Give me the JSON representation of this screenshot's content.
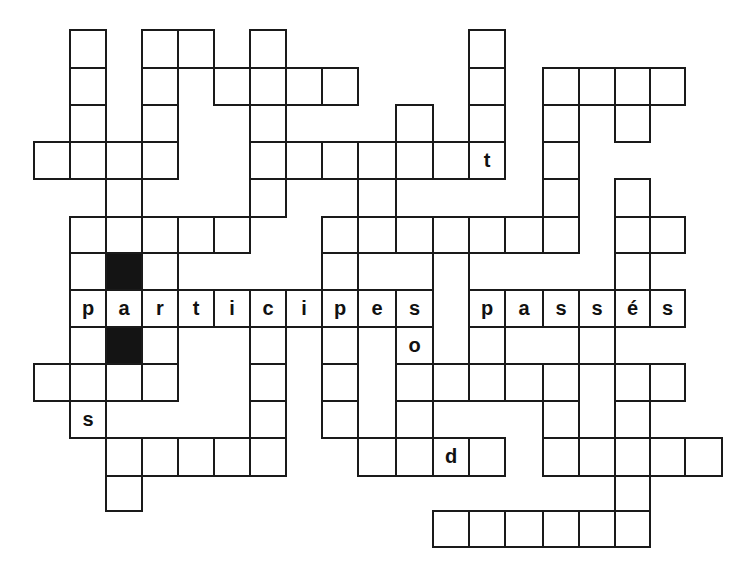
{
  "puzzle": {
    "title_fragment_visible": false,
    "cell_border_color": "#1a1a1a",
    "black_cell_color": "#141414",
    "background_color": "#ffffff",
    "col_edges": [
      34,
      70,
      106,
      142,
      178,
      214,
      250,
      286,
      322,
      358,
      396,
      433,
      469,
      505,
      543,
      579,
      615,
      650,
      685,
      722
    ],
    "row_edges": [
      30,
      68,
      105,
      142,
      179,
      217,
      253,
      290,
      327,
      364,
      401,
      438,
      476,
      511,
      547
    ],
    "horizontal_word": {
      "label": "participes passés",
      "row": 7
    },
    "cells": [
      {
        "r": 0,
        "c": 1
      },
      {
        "r": 0,
        "c": 3
      },
      {
        "r": 0,
        "c": 4
      },
      {
        "r": 0,
        "c": 6
      },
      {
        "r": 0,
        "c": 12
      },
      {
        "r": 1,
        "c": 1
      },
      {
        "r": 1,
        "c": 3
      },
      {
        "r": 1,
        "c": 5
      },
      {
        "r": 1,
        "c": 6
      },
      {
        "r": 1,
        "c": 7
      },
      {
        "r": 1,
        "c": 8
      },
      {
        "r": 1,
        "c": 12
      },
      {
        "r": 1,
        "c": 14
      },
      {
        "r": 1,
        "c": 15
      },
      {
        "r": 1,
        "c": 16
      },
      {
        "r": 1,
        "c": 17
      },
      {
        "r": 2,
        "c": 1
      },
      {
        "r": 2,
        "c": 3
      },
      {
        "r": 2,
        "c": 6
      },
      {
        "r": 2,
        "c": 10
      },
      {
        "r": 2,
        "c": 12
      },
      {
        "r": 2,
        "c": 14
      },
      {
        "r": 2,
        "c": 16
      },
      {
        "r": 3,
        "c": 0
      },
      {
        "r": 3,
        "c": 1
      },
      {
        "r": 3,
        "c": 2
      },
      {
        "r": 3,
        "c": 3
      },
      {
        "r": 3,
        "c": 6
      },
      {
        "r": 3,
        "c": 7
      },
      {
        "r": 3,
        "c": 8
      },
      {
        "r": 3,
        "c": 9
      },
      {
        "r": 3,
        "c": 10
      },
      {
        "r": 3,
        "c": 11
      },
      {
        "r": 3,
        "c": 12,
        "letter": "t"
      },
      {
        "r": 3,
        "c": 14
      },
      {
        "r": 4,
        "c": 2
      },
      {
        "r": 4,
        "c": 6
      },
      {
        "r": 4,
        "c": 9
      },
      {
        "r": 4,
        "c": 14
      },
      {
        "r": 4,
        "c": 16
      },
      {
        "r": 5,
        "c": 1
      },
      {
        "r": 5,
        "c": 2
      },
      {
        "r": 5,
        "c": 3
      },
      {
        "r": 5,
        "c": 4
      },
      {
        "r": 5,
        "c": 5
      },
      {
        "r": 5,
        "c": 8
      },
      {
        "r": 5,
        "c": 9
      },
      {
        "r": 5,
        "c": 10
      },
      {
        "r": 5,
        "c": 11
      },
      {
        "r": 5,
        "c": 12
      },
      {
        "r": 5,
        "c": 13
      },
      {
        "r": 5,
        "c": 14
      },
      {
        "r": 5,
        "c": 16
      },
      {
        "r": 5,
        "c": 17
      },
      {
        "r": 6,
        "c": 1
      },
      {
        "r": 6,
        "c": 2,
        "black": true
      },
      {
        "r": 6,
        "c": 3
      },
      {
        "r": 6,
        "c": 8
      },
      {
        "r": 6,
        "c": 9,
        "w": 2
      },
      {
        "r": 6,
        "c": 11,
        "h": 3
      },
      {
        "r": 6,
        "c": 16
      },
      {
        "r": 7,
        "c": 1,
        "letter": "p"
      },
      {
        "r": 7,
        "c": 2,
        "letter": "a"
      },
      {
        "r": 7,
        "c": 3,
        "letter": "r"
      },
      {
        "r": 7,
        "c": 4,
        "letter": "t"
      },
      {
        "r": 7,
        "c": 5,
        "letter": "i"
      },
      {
        "r": 7,
        "c": 6,
        "letter": "c"
      },
      {
        "r": 7,
        "c": 7,
        "letter": "i"
      },
      {
        "r": 7,
        "c": 8,
        "letter": "p"
      },
      {
        "r": 7,
        "c": 9,
        "letter": "e"
      },
      {
        "r": 7,
        "c": 10,
        "letter": "s"
      },
      {
        "r": 7,
        "c": 12,
        "letter": "p"
      },
      {
        "r": 7,
        "c": 13,
        "letter": "a"
      },
      {
        "r": 7,
        "c": 14,
        "letter": "s"
      },
      {
        "r": 7,
        "c": 15,
        "letter": "s"
      },
      {
        "r": 7,
        "c": 16,
        "letter": "é"
      },
      {
        "r": 7,
        "c": 17,
        "letter": "s"
      },
      {
        "r": 8,
        "c": 1
      },
      {
        "r": 8,
        "c": 2,
        "black": true
      },
      {
        "r": 8,
        "c": 3
      },
      {
        "r": 8,
        "c": 6
      },
      {
        "r": 8,
        "c": 8
      },
      {
        "r": 8,
        "c": 9,
        "h": 3
      },
      {
        "r": 8,
        "c": 10,
        "letter": "o"
      },
      {
        "r": 8,
        "c": 12
      },
      {
        "r": 8,
        "c": 13,
        "w": 2
      },
      {
        "r": 8,
        "c": 15
      },
      {
        "r": 9,
        "c": 0
      },
      {
        "r": 9,
        "c": 1
      },
      {
        "r": 9,
        "c": 2
      },
      {
        "r": 9,
        "c": 3
      },
      {
        "r": 9,
        "c": 6
      },
      {
        "r": 9,
        "c": 8
      },
      {
        "r": 9,
        "c": 10
      },
      {
        "r": 9,
        "c": 11
      },
      {
        "r": 9,
        "c": 12
      },
      {
        "r": 9,
        "c": 13
      },
      {
        "r": 9,
        "c": 14
      },
      {
        "r": 9,
        "c": 15,
        "h": 2
      },
      {
        "r": 9,
        "c": 16
      },
      {
        "r": 9,
        "c": 17
      },
      {
        "r": 10,
        "c": 1,
        "letter": "s"
      },
      {
        "r": 10,
        "c": 6
      },
      {
        "r": 10,
        "c": 8
      },
      {
        "r": 10,
        "c": 10
      },
      {
        "r": 10,
        "c": 14
      },
      {
        "r": 10,
        "c": 16
      },
      {
        "r": 11,
        "c": 2
      },
      {
        "r": 11,
        "c": 3
      },
      {
        "r": 11,
        "c": 4
      },
      {
        "r": 11,
        "c": 5
      },
      {
        "r": 11,
        "c": 6
      },
      {
        "r": 11,
        "c": 9
      },
      {
        "r": 11,
        "c": 10
      },
      {
        "r": 11,
        "c": 11,
        "letter": "d"
      },
      {
        "r": 11,
        "c": 12
      },
      {
        "r": 11,
        "c": 14
      },
      {
        "r": 11,
        "c": 15
      },
      {
        "r": 11,
        "c": 16
      },
      {
        "r": 11,
        "c": 17
      },
      {
        "r": 11,
        "c": 18
      },
      {
        "r": 12,
        "c": 2
      },
      {
        "r": 12,
        "c": 16
      },
      {
        "r": 13,
        "c": 11
      },
      {
        "r": 13,
        "c": 12
      },
      {
        "r": 13,
        "c": 13
      },
      {
        "r": 13,
        "c": 14
      },
      {
        "r": 13,
        "c": 15
      },
      {
        "r": 13,
        "c": 16
      }
    ]
  }
}
